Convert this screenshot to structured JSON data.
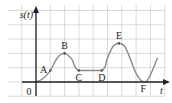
{
  "chart_data": {
    "type": "line",
    "title": "",
    "ylabel": "s(t)",
    "xlabel": "t",
    "origin_label": "0",
    "grid": true,
    "xlim": [
      -2,
      9
    ],
    "ylim": [
      -1,
      5.3
    ],
    "points": [
      {
        "label": "A",
        "x": 1.0,
        "y": 0.8,
        "label_side": "left"
      },
      {
        "label": "B",
        "x": 2.0,
        "y": 2.0,
        "label_side": "top"
      },
      {
        "label": "C",
        "x": 3.0,
        "y": 0.8,
        "label_side": "below"
      },
      {
        "label": "D",
        "x": 4.6,
        "y": 0.8,
        "label_side": "below"
      },
      {
        "label": "E",
        "x": 5.8,
        "y": 2.7,
        "label_side": "top"
      },
      {
        "label": "F",
        "x": 7.5,
        "y": 0.0,
        "label_side": "below"
      }
    ],
    "curve": [
      [
        0,
        0
      ],
      [
        0.5,
        0.25
      ],
      [
        1.0,
        0.8
      ],
      [
        1.5,
        1.7
      ],
      [
        2.0,
        2.0
      ],
      [
        2.5,
        1.6
      ],
      [
        3.0,
        0.8
      ],
      [
        4.6,
        0.8
      ],
      [
        5.0,
        1.7
      ],
      [
        5.4,
        2.5
      ],
      [
        5.8,
        2.7
      ],
      [
        6.2,
        2.5
      ],
      [
        6.6,
        1.6
      ],
      [
        7.0,
        0.6
      ],
      [
        7.5,
        0.0
      ],
      [
        7.9,
        0.3
      ],
      [
        8.5,
        1.7
      ]
    ],
    "colors": {
      "grid": "#cfcfcf",
      "axis": "#222222",
      "curve": "#8a8a8a",
      "point": "#555555"
    }
  }
}
